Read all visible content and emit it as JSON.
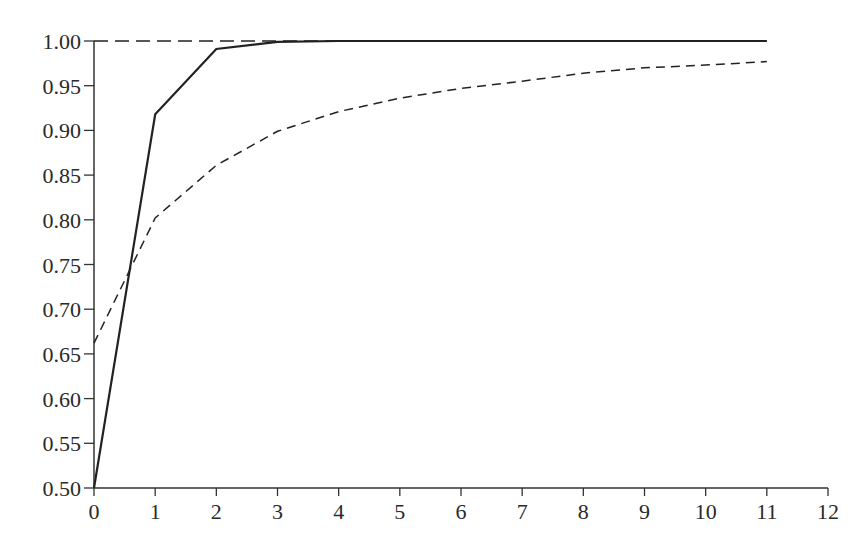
{
  "chart_data": {
    "type": "line",
    "title": "",
    "xlabel": "",
    "ylabel": "",
    "xlim": [
      0,
      12
    ],
    "ylim": [
      0.5,
      1.0
    ],
    "grid": false,
    "legend": null,
    "x_ticks": [
      "0",
      "1",
      "2",
      "3",
      "4",
      "5",
      "6",
      "7",
      "8",
      "9",
      "10",
      "11",
      "12"
    ],
    "y_ticks": [
      "0.50",
      "0.55",
      "0.60",
      "0.65",
      "0.70",
      "0.75",
      "0.80",
      "0.85",
      "0.90",
      "0.95",
      "1.00"
    ],
    "series": [
      {
        "name": "solid",
        "style": "solid",
        "x": [
          0,
          1,
          2,
          3,
          4,
          5,
          6,
          7,
          8,
          9,
          10,
          11
        ],
        "values": [
          0.5,
          0.918,
          0.991,
          0.999,
          1.0,
          1.0,
          1.0,
          1.0,
          1.0,
          1.0,
          1.0,
          1.0
        ]
      },
      {
        "name": "dashed",
        "style": "dashed",
        "x": [
          0,
          1,
          2,
          3,
          4,
          5,
          6,
          7,
          8,
          9,
          10,
          11
        ],
        "values": [
          0.662,
          0.802,
          0.861,
          0.899,
          0.921,
          0.936,
          0.947,
          0.955,
          0.964,
          0.97,
          0.973,
          0.977
        ]
      },
      {
        "name": "reference",
        "style": "long-dashed",
        "x": [
          0,
          11
        ],
        "values": [
          1.0,
          1.0
        ]
      }
    ],
    "colors": {
      "line": "#222222",
      "axis": "#333333",
      "background": "#ffffff"
    }
  }
}
